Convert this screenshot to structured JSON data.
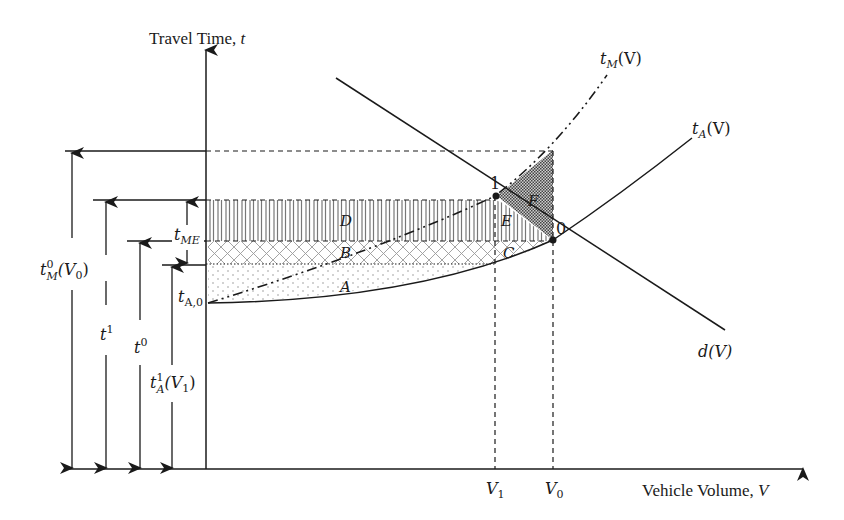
{
  "axes": {
    "y_title": "Travel Time, ",
    "y_var": "t",
    "x_title": "Vehicle Volume, ",
    "x_var": "V"
  },
  "curves": {
    "tM": {
      "base": "t",
      "sub": "M",
      "arg": "(V)"
    },
    "tA": {
      "base": "t",
      "sub": "A",
      "arg": "(V)"
    },
    "d": {
      "label": "d(V)"
    }
  },
  "points": {
    "p1": "1",
    "p0": "0"
  },
  "x_ticks": {
    "V1": {
      "base": "V",
      "sub": "1"
    },
    "V0": {
      "base": "V",
      "sub": "0"
    }
  },
  "left_labels": {
    "tM0V0": {
      "base": "t",
      "sup": "0",
      "sub": "M",
      "arg": "(V",
      "argsub": "0",
      "close": ")"
    },
    "t1": {
      "base": "t",
      "sup": "1"
    },
    "t0": {
      "base": "t",
      "sup": "0"
    },
    "tA1V1": {
      "base": "t",
      "sup": "1",
      "sub": "A",
      "arg": "(V",
      "argsub": "1",
      "close": ")"
    },
    "tME": {
      "base": "t",
      "sub": "ME"
    },
    "tA0": {
      "base": "t",
      "sub": "A,0"
    }
  },
  "regions": {
    "A": "A",
    "B": "B",
    "C": "C",
    "D": "D",
    "E": "E",
    "F": "F"
  },
  "colors": {
    "ink": "#1a1a1a",
    "shaded_F": "#555555",
    "pattern_gray": "#9a9a9a"
  }
}
